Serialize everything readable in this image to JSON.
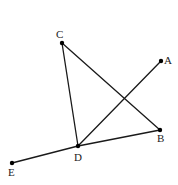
{
  "diagram": {
    "type": "geometry",
    "width": 178,
    "height": 185,
    "points": [
      {
        "id": "A",
        "label": "A",
        "x": 161,
        "y": 61,
        "label_x": 164,
        "label_y": 64
      },
      {
        "id": "B",
        "label": "B",
        "x": 160,
        "y": 130,
        "label_x": 157,
        "label_y": 142
      },
      {
        "id": "C",
        "label": "C",
        "x": 62,
        "y": 43,
        "label_x": 56,
        "label_y": 38
      },
      {
        "id": "D",
        "label": "D",
        "x": 78,
        "y": 146,
        "label_x": 74,
        "label_y": 161
      },
      {
        "id": "E",
        "label": "E",
        "x": 12,
        "y": 163,
        "label_x": 8,
        "label_y": 176
      }
    ],
    "segments": [
      {
        "from": "C",
        "to": "D"
      },
      {
        "from": "C",
        "to": "B"
      },
      {
        "from": "D",
        "to": "A"
      },
      {
        "from": "E",
        "to": "D"
      },
      {
        "from": "D",
        "to": "B"
      }
    ],
    "colors": {
      "line": "#1a1a1a",
      "point": "#000000",
      "label": "#222222",
      "background": "#ffffff"
    }
  }
}
